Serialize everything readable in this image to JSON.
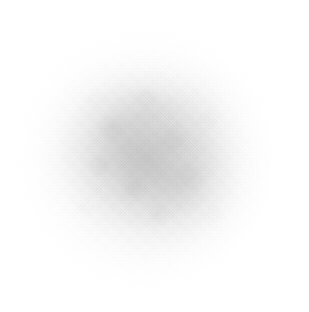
{
  "image": {
    "kind": "faint-radial-gradient-blob",
    "description": "A soft, diffuse grayish cloud on a plain white background with no legible text or interface elements.",
    "width_px": 309,
    "height_px": 312,
    "legible_text": "",
    "text_elements": []
  },
  "canvas": {
    "background_color": "#ffffff",
    "width_px": 309,
    "height_px": 312
  },
  "blob": {
    "center_x_px": 148,
    "center_y_px": 160,
    "radius_x_px": 120,
    "radius_y_px": 118,
    "darkest_color": "#a8a8a8",
    "mid_color": "#cecece",
    "edge_color": "#ffffff",
    "falloff": "smooth radial, fading fully to white before the image borders",
    "horizontal_extent_px": "30 to 280",
    "vertical_extent_px": "38 to 282",
    "texture": "mottled cloud blotches with fine diagonal weave grain"
  },
  "lobes": [
    {
      "name": "upper-left-lobe",
      "center_x_px": 126,
      "center_y_px": 146,
      "radius_x_px": 96,
      "radius_y_px": 86
    },
    {
      "name": "lower-right-lobe",
      "center_x_px": 176,
      "center_y_px": 186,
      "radius_x_px": 88,
      "radius_y_px": 80
    },
    {
      "name": "upper-lobe",
      "center_x_px": 150,
      "center_y_px": 112,
      "radius_x_px": 104,
      "radius_y_px": 62
    },
    {
      "name": "right-lobe",
      "center_x_px": 196,
      "center_y_px": 150,
      "radius_x_px": 70,
      "radius_y_px": 96
    }
  ],
  "corners": {
    "top_left_color": "#ffffff",
    "top_right_color": "#ffffff",
    "bottom_left_color": "#ffffff",
    "bottom_right_color": "#ffffff"
  }
}
